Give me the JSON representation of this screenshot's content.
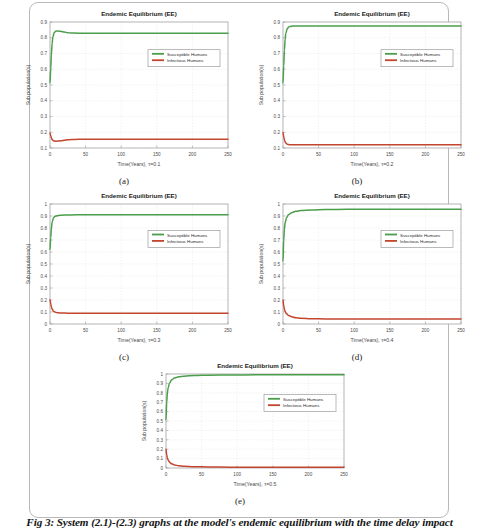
{
  "figure": {
    "caption": "Fig 3: System (2.1)-(2.3) graphs at the model's endemic equilibrium with the time delay impact",
    "page_border_color": "#b9b9b9",
    "background": "#ffffff"
  },
  "common": {
    "title": "Endemic Equilibrium (EE)",
    "ylabel": "Sub population(s)",
    "legend": [
      {
        "label": "Susceptible Humans",
        "color": "#4a9e4a"
      },
      {
        "label": "Infectious Humans",
        "color": "#c4452e"
      }
    ],
    "xticks": [
      "0",
      "50",
      "100",
      "150",
      "200",
      "250"
    ],
    "xlim": [
      0,
      250
    ],
    "axis_color": "#9a9a9a",
    "grid_color": "#d8d8d8",
    "title_color": "#1a1a1a",
    "tick_color": "#4a4a4a"
  },
  "chart_data": [
    {
      "id": "a",
      "panel_label": "(a)",
      "type": "line",
      "title": "Endemic Equilibrium (EE)",
      "xlabel": "Time(Years), τ=0.1",
      "ylabel": "Sub population(s)",
      "tau": 0.1,
      "xlim": [
        0,
        250
      ],
      "ylim": [
        0.1,
        0.9
      ],
      "yticks": [
        "0.1",
        "0.2",
        "0.3",
        "0.4",
        "0.5",
        "0.6",
        "0.7",
        "0.8",
        "0.9"
      ],
      "xticks": [
        "0",
        "50",
        "100",
        "150",
        "200",
        "250"
      ],
      "grid": true,
      "legend_position": "upper-right-inside",
      "series": [
        {
          "name": "Susceptible Humans",
          "color": "#4a9e4a",
          "x": [
            0,
            1,
            2,
            3,
            4,
            6,
            8,
            10,
            13,
            16,
            20,
            25,
            30,
            40,
            50,
            75,
            100,
            150,
            200,
            250
          ],
          "values": [
            0.515,
            0.6,
            0.7,
            0.765,
            0.805,
            0.833,
            0.841,
            0.843,
            0.842,
            0.84,
            0.836,
            0.832,
            0.83,
            0.829,
            0.829,
            0.829,
            0.829,
            0.829,
            0.829,
            0.829
          ]
        },
        {
          "name": "Infectious Humans",
          "color": "#c4452e",
          "x": [
            0,
            1,
            2,
            3,
            4,
            6,
            8,
            10,
            13,
            16,
            20,
            25,
            30,
            40,
            50,
            75,
            100,
            150,
            200,
            250
          ],
          "values": [
            0.196,
            0.178,
            0.163,
            0.154,
            0.149,
            0.1445,
            0.1435,
            0.1437,
            0.1448,
            0.1465,
            0.1492,
            0.152,
            0.1537,
            0.1552,
            0.1557,
            0.156,
            0.156,
            0.156,
            0.156,
            0.156
          ]
        }
      ]
    },
    {
      "id": "b",
      "panel_label": "(b)",
      "type": "line",
      "title": "Endemic Equilibrium (EE)",
      "xlabel": "Time(Years), τ=0.2",
      "ylabel": "Sub population(s)",
      "tau": 0.2,
      "xlim": [
        0,
        250
      ],
      "ylim": [
        0.1,
        0.9
      ],
      "yticks": [
        "0.1",
        "0.2",
        "0.3",
        "0.4",
        "0.5",
        "0.6",
        "0.7",
        "0.8",
        "0.9"
      ],
      "xticks": [
        "0",
        "50",
        "100",
        "150",
        "200",
        "250"
      ],
      "grid": true,
      "legend_position": "upper-right-inside",
      "series": [
        {
          "name": "Susceptible Humans",
          "color": "#4a9e4a",
          "x": [
            0,
            1,
            2,
            3,
            4,
            6,
            8,
            10,
            14,
            18,
            25,
            35,
            50,
            75,
            100,
            150,
            200,
            250
          ],
          "values": [
            0.513,
            0.62,
            0.72,
            0.79,
            0.828,
            0.858,
            0.868,
            0.872,
            0.874,
            0.8745,
            0.875,
            0.875,
            0.875,
            0.875,
            0.875,
            0.875,
            0.875,
            0.875
          ]
        },
        {
          "name": "Infectious Humans",
          "color": "#c4452e",
          "x": [
            0,
            1,
            2,
            3,
            4,
            6,
            8,
            10,
            14,
            18,
            25,
            35,
            50,
            75,
            100,
            150,
            200,
            250
          ],
          "values": [
            0.198,
            0.172,
            0.152,
            0.139,
            0.131,
            0.124,
            0.1215,
            0.1208,
            0.1205,
            0.1205,
            0.1205,
            0.1205,
            0.1205,
            0.1205,
            0.1205,
            0.1205,
            0.1205,
            0.1205
          ]
        }
      ]
    },
    {
      "id": "c",
      "panel_label": "(c)",
      "type": "line",
      "title": "Endemic Equilibrium (EE)",
      "xlabel": "Time(Years), τ=0.3",
      "ylabel": "Sub population(s)",
      "tau": 0.3,
      "xlim": [
        0,
        250
      ],
      "ylim": [
        0,
        1
      ],
      "yticks": [
        "0",
        "0.1",
        "0.2",
        "0.3",
        "0.4",
        "0.5",
        "0.6",
        "0.7",
        "0.8",
        "0.9",
        "1"
      ],
      "xticks": [
        "0",
        "50",
        "100",
        "150",
        "200",
        "250"
      ],
      "grid": true,
      "legend_position": "upper-right-inside",
      "series": [
        {
          "name": "Susceptible Humans",
          "color": "#4a9e4a",
          "x": [
            0,
            1,
            2,
            3,
            5,
            7,
            10,
            14,
            20,
            30,
            45,
            60,
            100,
            150,
            200,
            250
          ],
          "values": [
            0.62,
            0.72,
            0.8,
            0.85,
            0.885,
            0.897,
            0.903,
            0.906,
            0.908,
            0.909,
            0.91,
            0.91,
            0.91,
            0.91,
            0.91,
            0.91
          ]
        },
        {
          "name": "Infectious Humans",
          "color": "#c4452e",
          "x": [
            0,
            1,
            2,
            3,
            5,
            7,
            10,
            14,
            20,
            30,
            45,
            60,
            100,
            150,
            200,
            250
          ],
          "values": [
            0.203,
            0.168,
            0.142,
            0.124,
            0.106,
            0.099,
            0.0945,
            0.0922,
            0.0908,
            0.0898,
            0.0892,
            0.089,
            0.0888,
            0.0888,
            0.0888,
            0.0888
          ]
        }
      ]
    },
    {
      "id": "d",
      "panel_label": "(d)",
      "type": "line",
      "title": "Endemic Equilibrium (EE)",
      "xlabel": "Time(Years), τ=0.4",
      "ylabel": "Sub population(s)",
      "tau": 0.4,
      "xlim": [
        0,
        250
      ],
      "ylim": [
        0,
        1
      ],
      "yticks": [
        "0",
        "0.1",
        "0.2",
        "0.3",
        "0.4",
        "0.5",
        "0.6",
        "0.7",
        "0.8",
        "0.9",
        "1"
      ],
      "xticks": [
        "0",
        "50",
        "100",
        "150",
        "200",
        "250"
      ],
      "grid": true,
      "legend_position": "upper-right-inside",
      "series": [
        {
          "name": "Susceptible Humans",
          "color": "#4a9e4a",
          "x": [
            0,
            1,
            2,
            3,
            5,
            8,
            12,
            18,
            25,
            40,
            60,
            90,
            130,
            180,
            250
          ],
          "values": [
            0.525,
            0.7,
            0.795,
            0.845,
            0.888,
            0.912,
            0.928,
            0.939,
            0.945,
            0.951,
            0.954,
            0.956,
            0.957,
            0.957,
            0.957
          ]
        },
        {
          "name": "Infectious Humans",
          "color": "#c4452e",
          "x": [
            0,
            1,
            2,
            3,
            5,
            8,
            12,
            18,
            25,
            40,
            60,
            90,
            130,
            180,
            250
          ],
          "values": [
            0.199,
            0.152,
            0.122,
            0.104,
            0.085,
            0.07,
            0.06,
            0.052,
            0.048,
            0.0445,
            0.0425,
            0.0415,
            0.041,
            0.041,
            0.041
          ]
        }
      ]
    },
    {
      "id": "e",
      "panel_label": "(e)",
      "type": "line",
      "title": "Endemic Equilibrium (EE)",
      "xlabel": "Time(Years), τ=0.5",
      "ylabel": "Sub population(s)",
      "tau": 0.5,
      "xlim": [
        0,
        250
      ],
      "ylim": [
        0,
        1
      ],
      "yticks": [
        "0",
        "0.1",
        "0.2",
        "0.3",
        "0.4",
        "0.5",
        "0.6",
        "0.7",
        "0.8",
        "0.9",
        "1"
      ],
      "xticks": [
        "0",
        "50",
        "100",
        "150",
        "200",
        "250"
      ],
      "grid": true,
      "legend_position": "upper-right-inside",
      "series": [
        {
          "name": "Susceptible Humans",
          "color": "#4a9e4a",
          "x": [
            0,
            1,
            2,
            3,
            5,
            8,
            12,
            18,
            25,
            40,
            60,
            90,
            130,
            180,
            250
          ],
          "values": [
            0.512,
            0.7,
            0.8,
            0.855,
            0.905,
            0.938,
            0.958,
            0.97,
            0.977,
            0.984,
            0.988,
            0.99,
            0.991,
            0.992,
            0.992
          ]
        },
        {
          "name": "Infectious Humans",
          "color": "#c4452e",
          "x": [
            0,
            1,
            2,
            3,
            5,
            8,
            12,
            18,
            25,
            40,
            60,
            90,
            130,
            180,
            250
          ],
          "values": [
            0.2,
            0.14,
            0.105,
            0.085,
            0.062,
            0.044,
            0.032,
            0.024,
            0.019,
            0.0135,
            0.0105,
            0.009,
            0.008,
            0.0075,
            0.007
          ]
        }
      ]
    }
  ]
}
